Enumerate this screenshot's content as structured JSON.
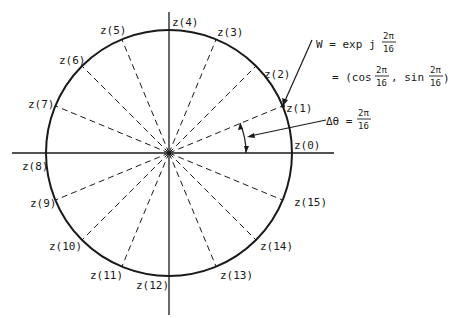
{
  "diagram": {
    "center": {
      "x": 169,
      "y": 153
    },
    "radius": 123,
    "points": [
      {
        "label": "z(0)",
        "index": 0
      },
      {
        "label": "z(1)",
        "index": 1
      },
      {
        "label": "z(2)",
        "index": 2
      },
      {
        "label": "z(3)",
        "index": 3
      },
      {
        "label": "z(4)",
        "index": 4
      },
      {
        "label": "z(5)",
        "index": 5
      },
      {
        "label": "z(6)",
        "index": 6
      },
      {
        "label": "z(7)",
        "index": 7
      },
      {
        "label": "z(8)",
        "index": 8
      },
      {
        "label": "z(9)",
        "index": 9
      },
      {
        "label": "z(10)",
        "index": 10
      },
      {
        "label": "z(11)",
        "index": 11
      },
      {
        "label": "z(12)",
        "index": 12
      },
      {
        "label": "z(13)",
        "index": 13
      },
      {
        "label": "z(14)",
        "index": 14
      },
      {
        "label": "z(15)",
        "index": 15
      }
    ],
    "annotations": {
      "w_lhs": "W = exp j",
      "w_frac_num": "2π",
      "w_frac_den": "16",
      "w_eq2_open": "= (cos",
      "w_eq2_num1": "2π",
      "w_eq2_den1": "16",
      "w_eq2_sep": ", sin",
      "w_eq2_num2": "2π",
      "w_eq2_den2": "16",
      "w_eq2_close": ")",
      "dtheta_lhs": "Δθ =",
      "dtheta_num": "2π",
      "dtheta_den": "16"
    },
    "colors": {
      "ink": "#1a1a1a",
      "background": "#ffffff"
    }
  }
}
